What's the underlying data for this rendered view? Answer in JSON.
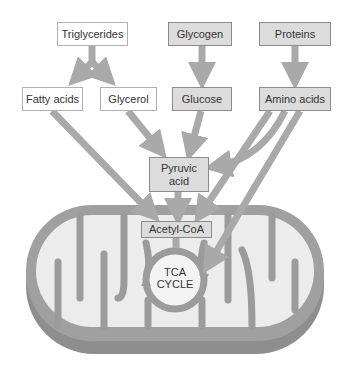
{
  "diagram": {
    "sources": [
      {
        "id": "triglycerides",
        "label": "Triglycerides",
        "style": "white"
      },
      {
        "id": "glycogen",
        "label": "Glycogen",
        "style": "shaded"
      },
      {
        "id": "proteins",
        "label": "Proteins",
        "style": "shaded"
      }
    ],
    "intermediates": [
      {
        "id": "fatty_acids",
        "label": "Fatty acids",
        "style": "white"
      },
      {
        "id": "glycerol",
        "label": "Glycerol",
        "style": "white"
      },
      {
        "id": "glucose",
        "label": "Glucose",
        "style": "shaded"
      },
      {
        "id": "amino_acids",
        "label": "Amino acids",
        "style": "shaded"
      }
    ],
    "pyruvic_acid": {
      "line1": "Pyruvic",
      "line2": "acid"
    },
    "acetyl_coa": {
      "label": "Acetyl-CoA"
    },
    "tca_cycle": {
      "line1": "TCA",
      "line2": "CYCLE"
    },
    "organelle": "mitochondrion",
    "edges": [
      [
        "Triglycerides",
        "Fatty acids"
      ],
      [
        "Triglycerides",
        "Glycerol"
      ],
      [
        "Glycogen",
        "Glucose"
      ],
      [
        "Proteins",
        "Amino acids"
      ],
      [
        "Fatty acids",
        "Acetyl-CoA"
      ],
      [
        "Glycerol",
        "Pyruvic acid"
      ],
      [
        "Glucose",
        "Pyruvic acid"
      ],
      [
        "Amino acids",
        "Pyruvic acid"
      ],
      [
        "Amino acids",
        "Acetyl-CoA"
      ],
      [
        "Amino acids",
        "TCA CYCLE"
      ],
      [
        "Pyruvic acid",
        "Acetyl-CoA"
      ],
      [
        "Acetyl-CoA",
        "TCA CYCLE"
      ]
    ],
    "colors": {
      "arrow": "#a9a9a9",
      "membrane": "#9b9b9b",
      "matrix": "#ececec",
      "shaded_box": "#dcdcdc",
      "white_box": "#ffffff",
      "text": "#333333"
    }
  }
}
